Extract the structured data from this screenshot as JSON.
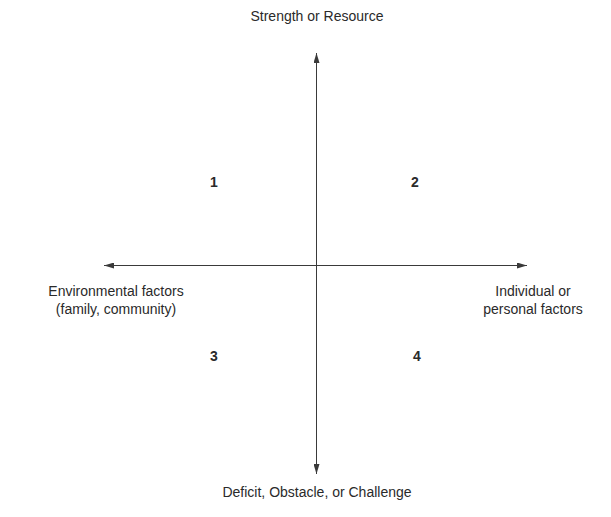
{
  "diagram": {
    "type": "quadrant",
    "axes": {
      "vertical": {
        "top_label": "Strength or Resource",
        "bottom_label": "Deficit, Obstacle, or Challenge"
      },
      "horizontal": {
        "left_label_line1": "Environmental factors",
        "left_label_line2": "(family, community)",
        "right_label_line1": "Individual or",
        "right_label_line2": "personal factors"
      }
    },
    "quadrants": [
      {
        "id": "1",
        "label": "1",
        "position": "top-left"
      },
      {
        "id": "2",
        "label": "2",
        "position": "top-right"
      },
      {
        "id": "3",
        "label": "3",
        "position": "bottom-left"
      },
      {
        "id": "4",
        "label": "4",
        "position": "bottom-right"
      }
    ],
    "colors": {
      "line": "#3a3a3a",
      "text": "#2a2a2a",
      "background": "#ffffff"
    }
  }
}
